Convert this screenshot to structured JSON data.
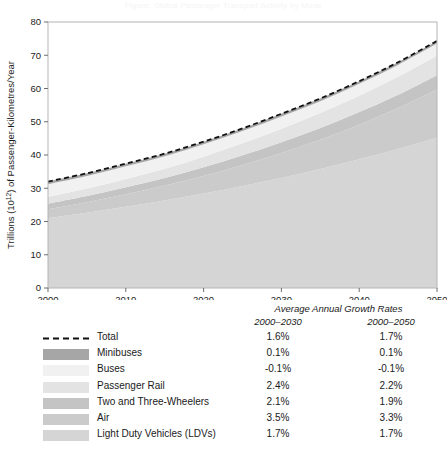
{
  "chart_data": {
    "type": "area",
    "title": "Figure: Global Passenger Transport Activity by Mode",
    "xlabel": "",
    "ylabel": "Trillions (10¹²) of Passenger-Kilometres/Year",
    "ylabel_parts": {
      "pre": "Trillions (10",
      "sup": "12",
      "post": ") of Passenger-Kilometres/Year"
    },
    "xlim": [
      2000,
      2050
    ],
    "ylim": [
      0,
      80
    ],
    "xticks": [
      2000,
      2010,
      2020,
      2030,
      2040,
      2050
    ],
    "yticks": [
      0,
      10,
      20,
      30,
      40,
      50,
      60,
      70,
      80
    ],
    "grid": false,
    "legend_position": "below-plot",
    "stack_order_bottom_to_top": [
      "Light Duty Vehicles (LDVs)",
      "Air",
      "Two and Three-Wheelers",
      "Passenger Rail",
      "Buses",
      "Minibuses"
    ],
    "x": [
      2000,
      2005,
      2010,
      2015,
      2020,
      2025,
      2030,
      2035,
      2040,
      2045,
      2050
    ],
    "series": [
      {
        "name": "Light Duty Vehicles (LDVs)",
        "color": "#d5d5d5",
        "values": [
          21.0,
          22.6,
          24.4,
          26.3,
          28.4,
          30.7,
          33.1,
          35.8,
          38.7,
          41.8,
          45.2
        ]
      },
      {
        "name": "Air",
        "color": "#cbcbcb",
        "values": [
          2.7,
          3.2,
          3.8,
          4.5,
          5.3,
          6.3,
          7.5,
          8.8,
          10.4,
          12.3,
          14.5
        ]
      },
      {
        "name": "Two and Three-Wheelers",
        "color": "#c4c4c4",
        "values": [
          1.7,
          1.9,
          2.1,
          2.3,
          2.6,
          2.9,
          3.2,
          3.5,
          3.8,
          4.0,
          4.3
        ]
      },
      {
        "name": "Passenger Rail",
        "color": "#e3e3e3",
        "values": [
          2.0,
          2.2,
          2.5,
          2.8,
          3.2,
          3.6,
          4.1,
          4.5,
          4.9,
          5.4,
          5.9
        ]
      },
      {
        "name": "Buses",
        "color": "#f1f1f1",
        "values": [
          3.8,
          3.8,
          3.8,
          3.7,
          3.7,
          3.7,
          3.7,
          3.6,
          3.6,
          3.6,
          3.6
        ]
      },
      {
        "name": "Minibuses",
        "color": "#a6a6a6",
        "values": [
          0.8,
          0.8,
          0.8,
          0.8,
          0.8,
          0.8,
          0.8,
          0.8,
          0.8,
          0.8,
          0.8
        ]
      }
    ],
    "total": {
      "name": "Total",
      "style": "dashed",
      "color": "#111111",
      "values": [
        32.0,
        34.5,
        37.4,
        40.4,
        44.0,
        48.0,
        52.4,
        57.0,
        62.2,
        67.9,
        74.3
      ]
    }
  },
  "legend": {
    "growth_header": "Average Annual Growth Rates",
    "col1_header": "2000–2030",
    "col2_header": "2000–2050",
    "rows": [
      {
        "label": "Total",
        "swatch": "dashed-line",
        "color": "#111111",
        "g2030": "1.6%",
        "g2050": "1.7%"
      },
      {
        "label": "Minibuses",
        "swatch": "solid-fill",
        "color": "#a6a6a6",
        "g2030": "0.1%",
        "g2050": "0.1%"
      },
      {
        "label": "Buses",
        "swatch": "solid-fill",
        "color": "#f1f1f1",
        "g2030": "-0.1%",
        "g2050": "-0.1%"
      },
      {
        "label": "Passenger Rail",
        "swatch": "solid-fill",
        "color": "#e3e3e3",
        "g2030": "2.4%",
        "g2050": "2.2%"
      },
      {
        "label": "Two and Three-Wheelers",
        "swatch": "solid-fill",
        "color": "#c4c4c4",
        "g2030": "2.1%",
        "g2050": "1.9%"
      },
      {
        "label": "Air",
        "swatch": "solid-fill",
        "color": "#cbcbcb",
        "g2030": "3.5%",
        "g2050": "3.3%"
      },
      {
        "label": "Light Duty Vehicles (LDVs)",
        "swatch": "solid-fill",
        "color": "#d5d5d5",
        "g2030": "1.7%",
        "g2050": "1.7%"
      }
    ]
  },
  "style": {
    "frame_color": "#b4b4b4",
    "tick_color": "#6e6e6e",
    "background": "#ffffff"
  }
}
